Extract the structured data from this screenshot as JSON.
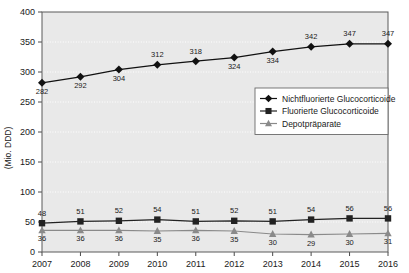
{
  "chart_data": {
    "type": "line",
    "title": "",
    "xlabel": "",
    "ylabel": "(Mio. DDD)",
    "categories": [
      "2007",
      "2008",
      "2009",
      "2010",
      "2011",
      "2012",
      "2013",
      "2014",
      "2015",
      "2016"
    ],
    "ylim": [
      0,
      400
    ],
    "yticks": [
      0,
      50,
      100,
      150,
      200,
      250,
      300,
      350,
      400
    ],
    "grid": true,
    "legend_position": "center-right",
    "series": [
      {
        "name": "Nichtfluorierte Glucocorticoide",
        "marker": "diamond",
        "color": "#111111",
        "values": [
          282,
          292,
          304,
          312,
          318,
          324,
          334,
          342,
          347,
          347
        ],
        "label_positions": [
          "below",
          "below",
          "below",
          "above",
          "above",
          "below",
          "below",
          "above",
          "above",
          "above"
        ]
      },
      {
        "name": "Fluorierte Glucocorticoide",
        "marker": "square",
        "color": "#222222",
        "values": [
          48,
          51,
          52,
          54,
          51,
          52,
          51,
          54,
          56,
          56
        ],
        "label_positions": [
          "above",
          "above",
          "above",
          "above",
          "above",
          "above",
          "above",
          "above",
          "above",
          "above"
        ]
      },
      {
        "name": "Depotpräparate",
        "marker": "triangle",
        "color": "#8a8a8a",
        "values": [
          36,
          36,
          36,
          35,
          36,
          35,
          30,
          29,
          30,
          31
        ],
        "label_positions": [
          "below",
          "below",
          "below",
          "below",
          "below",
          "below",
          "below",
          "below",
          "below",
          "below"
        ]
      }
    ]
  },
  "legend": {
    "items": [
      {
        "label": "Nichtfluorierte Glucocorticoide",
        "marker": "diamond",
        "color": "#111111"
      },
      {
        "label": "Fluorierte Glucocorticoide",
        "marker": "square",
        "color": "#222222"
      },
      {
        "label": "Depotpräparate",
        "marker": "triangle",
        "color": "#8a8a8a"
      }
    ]
  },
  "colors": {
    "plot_background": "#e9e9e9",
    "page_background": "#ffffff",
    "frame": "#5a5a5a",
    "gridline": "#ffffff",
    "text": "#1a1a1a"
  }
}
